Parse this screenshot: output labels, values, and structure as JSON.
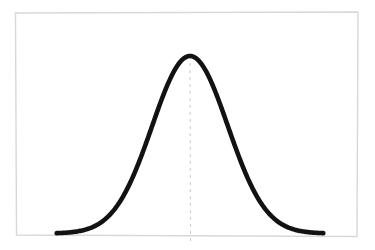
{
  "figure": {
    "background_color": "#ffffff",
    "width": 375,
    "height": 250
  },
  "frame": {
    "name": "plot-frame",
    "color": "#d8d8d8",
    "stroke_width": 1.4,
    "corners": {
      "top_left": [
        15.5,
        13.0
      ],
      "top_right": [
        358.0,
        12.0
      ],
      "bottom_right": [
        357.0,
        236.5
      ],
      "bottom_left": [
        16.5,
        235.0
      ]
    }
  },
  "chart_data": {
    "type": "line",
    "title": "",
    "subtitle": "",
    "xlabel": "",
    "ylabel": "",
    "grid": false,
    "legend": "none",
    "xlim": [
      -4.2,
      4.2
    ],
    "ylim": [
      0,
      0.44
    ],
    "xticks": [],
    "yticks": [],
    "xticklabels": [],
    "yticklabels": [],
    "annotations": [
      {
        "name": "mean-line",
        "kind": "vertical-dashed-line",
        "x": 0,
        "label": "",
        "color": "#cfcfcf",
        "dash": "3 4",
        "width": 1.1
      }
    ],
    "series": [
      {
        "name": "normal-distribution",
        "color": "#121212",
        "line_width": 4.6,
        "distribution": "gaussian",
        "mean": 0,
        "sigma": 1,
        "x": [
          -3.5,
          -3.3,
          -3.1,
          -2.9,
          -2.7,
          -2.5,
          -2.3,
          -2.1,
          -1.9,
          -1.7,
          -1.5,
          -1.3,
          -1.1,
          -0.9,
          -0.7,
          -0.5,
          -0.3,
          -0.1,
          0.1,
          0.3,
          0.5,
          0.7,
          0.9,
          1.1,
          1.3,
          1.5,
          1.7,
          1.9,
          2.1,
          2.3,
          2.5,
          2.7,
          2.9,
          3.1,
          3.3,
          3.5
        ],
        "values": [
          0.0009,
          0.0017,
          0.0033,
          0.006,
          0.0104,
          0.0175,
          0.0283,
          0.044,
          0.0656,
          0.094,
          0.1295,
          0.1714,
          0.2179,
          0.2661,
          0.3123,
          0.3521,
          0.3814,
          0.397,
          0.397,
          0.3814,
          0.3521,
          0.3123,
          0.2661,
          0.2179,
          0.1714,
          0.1295,
          0.094,
          0.0656,
          0.044,
          0.0283,
          0.0175,
          0.0104,
          0.006,
          0.0033,
          0.0017,
          0.0009
        ]
      }
    ]
  }
}
